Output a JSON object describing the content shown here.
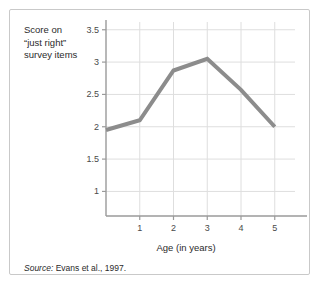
{
  "figure": {
    "y_axis_caption": "Score on\n“just right”\nsurvey items",
    "x_axis_caption": "Age (in years)",
    "source_label": "Source:",
    "source_text": " Evans et al., 1997."
  },
  "chart_data": {
    "type": "line",
    "title": "",
    "xlabel": "Age (in years)",
    "ylabel": "Score on “just right” survey items",
    "x": [
      0,
      1,
      2,
      3,
      4,
      5
    ],
    "values": [
      1.95,
      2.1,
      2.87,
      3.05,
      2.57,
      2.0
    ],
    "xlim": [
      0,
      5.6
    ],
    "ylim": [
      0.62,
      3.62
    ],
    "xticks": [
      1,
      2,
      3,
      4,
      5
    ],
    "xtick_labels": [
      "1",
      "2",
      "3",
      "4",
      "5"
    ],
    "yticks": [
      1,
      1.5,
      2,
      2.5,
      3,
      3.5
    ],
    "ytick_labels": [
      "1",
      "1.5",
      "2",
      "2.5",
      "3",
      "3.5"
    ],
    "grid": "horizontal-and-vertical",
    "legend": "none",
    "line_color": "#8c8c8c",
    "grid_color": "#dedede",
    "axis_color": "#9a9a9a",
    "line_width": 4
  }
}
